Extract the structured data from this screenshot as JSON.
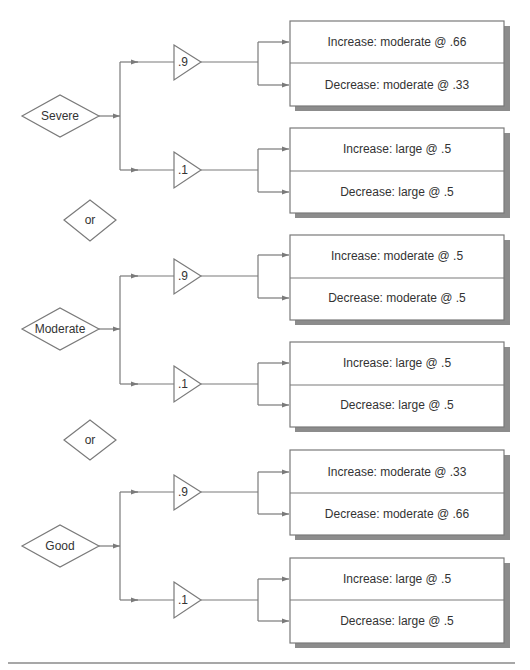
{
  "diagram": {
    "colors": {
      "line": "#7a7a7a",
      "shadow": "#8c8c8c",
      "text": "#333333",
      "background": "#ffffff"
    },
    "separators": [
      {
        "label": "or"
      },
      {
        "label": "or"
      }
    ],
    "groups": [
      {
        "state": "Severe",
        "branches": [
          {
            "probability": ".9",
            "outcomes": [
              {
                "text": "Increase: moderate @ .66"
              },
              {
                "text": "Decrease: moderate @ .33"
              }
            ]
          },
          {
            "probability": ".1",
            "outcomes": [
              {
                "text": "Increase: large @ .5"
              },
              {
                "text": "Decrease: large @ .5"
              }
            ]
          }
        ]
      },
      {
        "state": "Moderate",
        "branches": [
          {
            "probability": ".9",
            "outcomes": [
              {
                "text": "Increase: moderate @ .5"
              },
              {
                "text": "Decrease: moderate @ .5"
              }
            ]
          },
          {
            "probability": ".1",
            "outcomes": [
              {
                "text": "Increase: large @ .5"
              },
              {
                "text": "Decrease: large @ .5"
              }
            ]
          }
        ]
      },
      {
        "state": "Good",
        "branches": [
          {
            "probability": ".9",
            "outcomes": [
              {
                "text": "Increase: moderate @ .33"
              },
              {
                "text": "Decrease: moderate @ .66"
              }
            ]
          },
          {
            "probability": ".1",
            "outcomes": [
              {
                "text": "Increase: large @ .5"
              },
              {
                "text": "Decrease: large @ .5"
              }
            ]
          }
        ]
      }
    ]
  }
}
